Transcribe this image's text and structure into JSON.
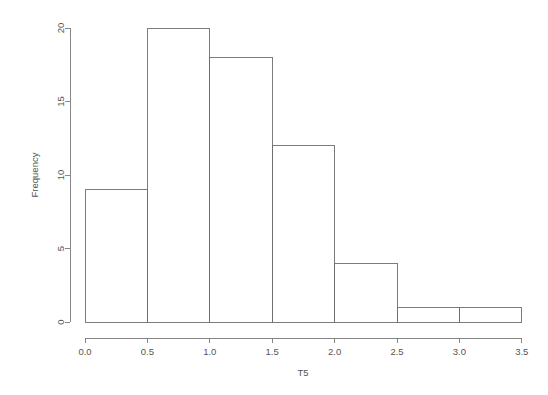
{
  "chart_data": {
    "type": "bar",
    "subtype": "histogram",
    "title": "",
    "xlabel": "T5",
    "ylabel": "Frequency",
    "xlim": [
      0.0,
      3.5
    ],
    "ylim": [
      0,
      20
    ],
    "bin_width": 0.5,
    "bin_edges": [
      0.0,
      0.5,
      1.0,
      1.5,
      2.0,
      2.5,
      3.0,
      3.5
    ],
    "categories": [
      "0.0-0.5",
      "0.5-1.0",
      "1.0-1.5",
      "1.5-2.0",
      "2.0-2.5",
      "2.5-3.0",
      "3.0-3.5"
    ],
    "values": [
      9,
      20,
      18,
      12,
      4,
      1,
      1
    ],
    "total_count": 65,
    "xticks": [
      "0.0",
      "0.5",
      "1.0",
      "1.5",
      "2.0",
      "2.5",
      "3.0",
      "3.5"
    ],
    "xtick_values": [
      0.0,
      0.5,
      1.0,
      1.5,
      2.0,
      2.5,
      3.0,
      3.5
    ],
    "yticks": [
      "0",
      "5",
      "10",
      "15",
      "20"
    ],
    "ytick_values": [
      0,
      5,
      10,
      15,
      20
    ],
    "grid": false,
    "legend": false,
    "legend_position": "none",
    "bar_fill": "#ffffff",
    "bar_stroke": "#6e6e6e",
    "axis_color": "#7a7a7a",
    "background": "#ffffff",
    "text_color": "#555555"
  }
}
